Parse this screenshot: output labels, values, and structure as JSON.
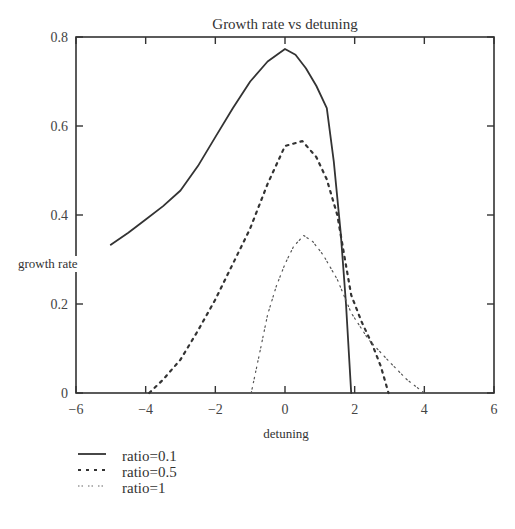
{
  "chart_data": {
    "type": "line",
    "title": "Growth rate vs detuning",
    "xlabel": "detuning",
    "ylabel": "growth rate",
    "xlim": [
      -6,
      6
    ],
    "ylim": [
      0,
      0.8
    ],
    "xticks": [
      -6,
      -4,
      -2,
      0,
      2,
      4,
      6
    ],
    "xtick_labels": [
      "−6",
      "−4",
      "−2",
      "0",
      "2",
      "4",
      "6"
    ],
    "yticks": [
      0,
      0.2,
      0.4,
      0.6,
      0.8
    ],
    "ytick_labels": [
      "0",
      "0.2",
      "0.4",
      "0.6",
      "0.8"
    ],
    "grid": false,
    "legend_position": "below-left",
    "series": [
      {
        "name": "ratio=0.1",
        "style": "solid",
        "color": "#333333",
        "x": [
          -5.0,
          -4.5,
          -4.0,
          -3.5,
          -3.0,
          -2.5,
          -2.0,
          -1.5,
          -1.0,
          -0.5,
          0.0,
          0.3,
          0.6,
          0.9,
          1.2,
          1.4,
          1.6,
          1.75,
          1.9
        ],
        "y": [
          0.333,
          0.36,
          0.39,
          0.42,
          0.455,
          0.51,
          0.575,
          0.64,
          0.7,
          0.745,
          0.773,
          0.76,
          0.73,
          0.69,
          0.64,
          0.52,
          0.36,
          0.2,
          0.0
        ]
      },
      {
        "name": "ratio=0.5",
        "style": "dashed",
        "color": "#333333",
        "x": [
          -3.9,
          -3.5,
          -3.0,
          -2.5,
          -2.0,
          -1.5,
          -1.0,
          -0.5,
          0.0,
          0.5,
          0.9,
          1.2,
          1.5,
          1.7,
          1.9,
          2.2,
          2.5,
          2.75,
          2.97
        ],
        "y": [
          0.0,
          0.03,
          0.075,
          0.14,
          0.21,
          0.29,
          0.37,
          0.47,
          0.555,
          0.566,
          0.53,
          0.48,
          0.4,
          0.31,
          0.22,
          0.16,
          0.11,
          0.06,
          0.0
        ]
      },
      {
        "name": "ratio=1",
        "style": "dash-dot",
        "color": "#555555",
        "x": [
          -0.97,
          -0.7,
          -0.5,
          -0.25,
          0.0,
          0.25,
          0.54,
          0.8,
          1.1,
          1.5,
          1.9,
          2.4,
          3.0,
          3.5,
          4.0
        ],
        "y": [
          0.0,
          0.1,
          0.176,
          0.24,
          0.29,
          0.33,
          0.354,
          0.34,
          0.31,
          0.255,
          0.18,
          0.12,
          0.07,
          0.03,
          0.0
        ]
      }
    ]
  }
}
